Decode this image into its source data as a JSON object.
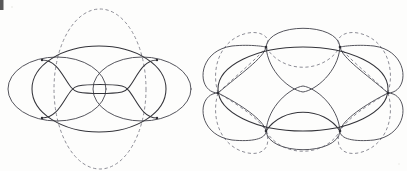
{
  "page": {
    "background_color": "#fdfdfc",
    "width": 407,
    "height": 171
  },
  "style": {
    "solid_stroke_color": "#34343a",
    "solid_light_stroke_color": "#55555d",
    "dashed_stroke_color": "#8d8d96",
    "vertex_color": "#2e2e34",
    "dash_pattern": "3.2 2.6",
    "stroke_width": 1.05
  },
  "figures": [
    {
      "id": "left-figure",
      "name": "theta-graph-embedding-left",
      "description": "Large solid ellipse with two side circles, a vertical dashed circle, and two inner wavy curves meeting at four vertices",
      "center": {
        "x": 99,
        "y": 89
      },
      "ellipse": {
        "rx": 67,
        "ry": 43
      },
      "vertices": [
        {
          "label": "upper-left",
          "x": 42,
          "y": 60
        },
        {
          "label": "upper-right",
          "x": 157,
          "y": 60
        },
        {
          "label": "lower-left",
          "x": 42,
          "y": 118
        },
        {
          "label": "lower-right",
          "x": 157,
          "y": 118
        }
      ],
      "dashed_circle": {
        "cx": 100,
        "cy": 89,
        "rx": 46,
        "ry": 80
      },
      "side_circles": [
        {
          "cx": 56,
          "cy": 89,
          "rx": 48,
          "ry": 33
        },
        {
          "cx": 143,
          "cy": 89,
          "rx": 48,
          "ry": 33
        }
      ],
      "wave_count": 2
    },
    {
      "id": "right-figure",
      "name": "theta-graph-embedding-right",
      "description": "Solid ellipse crossed by four lobed circles and dashed arcs forming a six-vertex rosette",
      "center": {
        "x": 303,
        "y": 89
      },
      "ellipse": {
        "rx": 85,
        "ry": 42
      },
      "vertices": [
        {
          "label": "left",
          "x": 218,
          "y": 93
        },
        {
          "label": "right",
          "x": 388,
          "y": 93
        },
        {
          "label": "upper-left",
          "x": 266,
          "y": 47
        },
        {
          "label": "upper-right",
          "x": 340,
          "y": 47
        },
        {
          "label": "lower-left",
          "x": 266,
          "y": 131
        },
        {
          "label": "lower-right",
          "x": 340,
          "y": 131
        }
      ],
      "lobe_count": 4,
      "dashed_lobe_count": 4
    }
  ],
  "artifacts": {
    "corner_mark": {
      "x": 0,
      "y": 0,
      "width": 4,
      "height": 10
    },
    "specks": [
      {
        "x": 12,
        "y": 7,
        "r": 0.8
      },
      {
        "x": 399,
        "y": 164,
        "r": 0.7
      }
    ]
  },
  "caption": {
    "text": ""
  }
}
